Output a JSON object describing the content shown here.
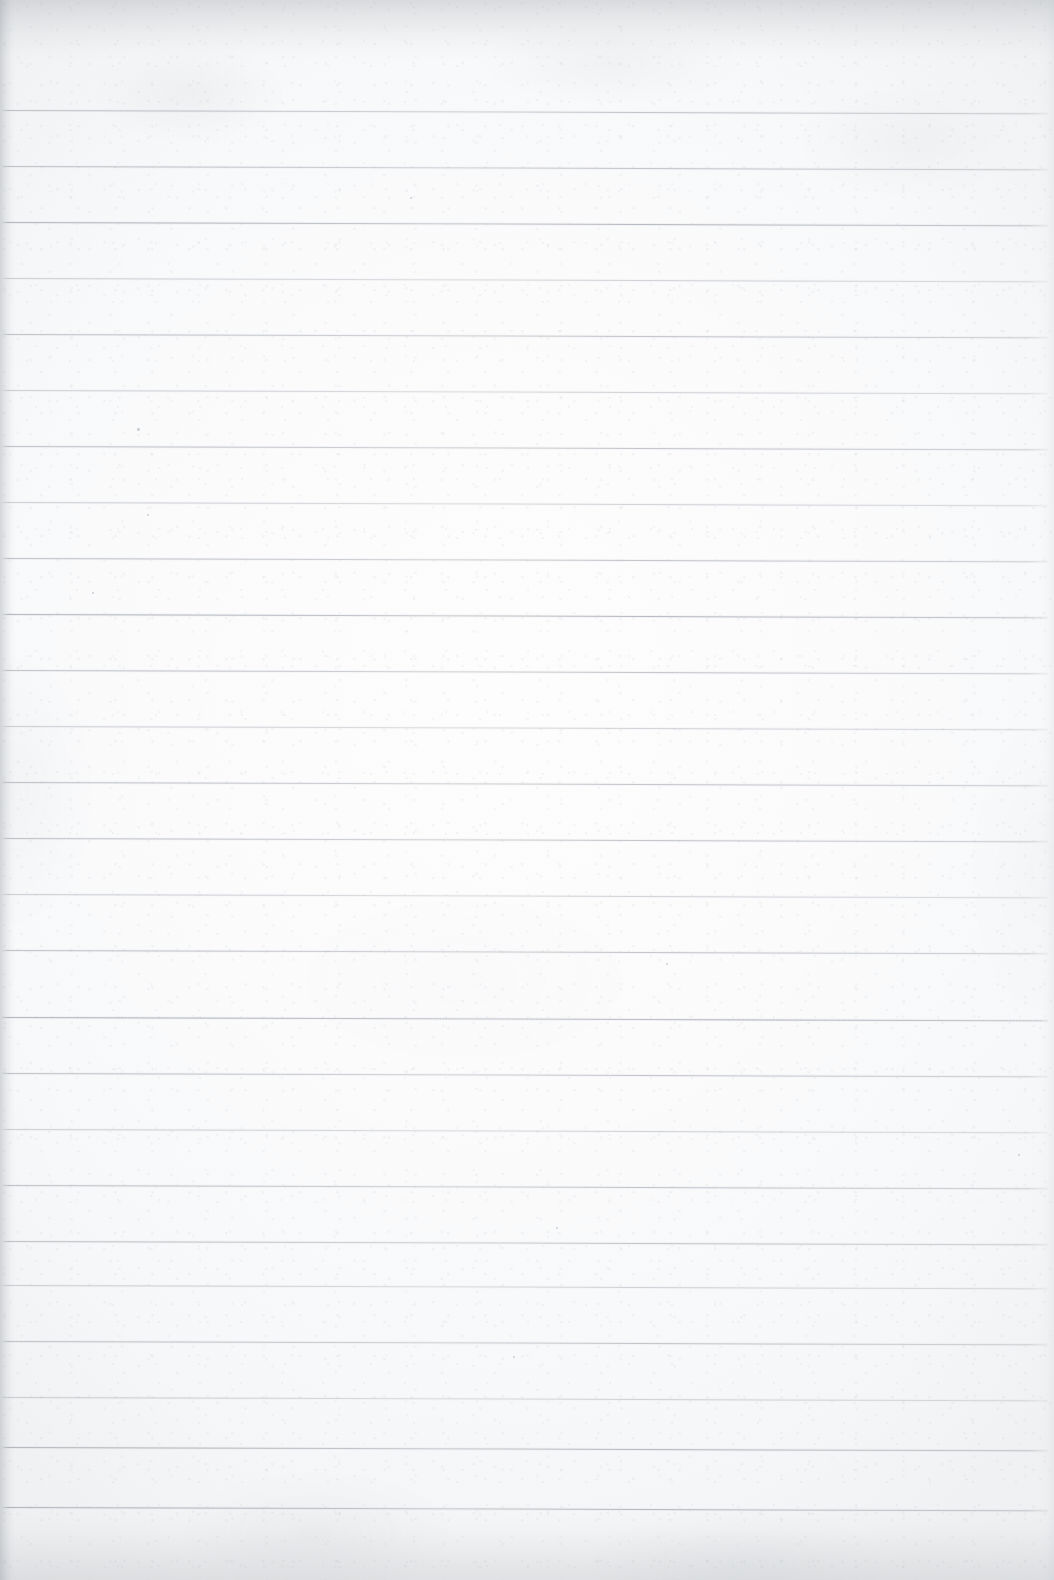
{
  "document": {
    "kind": "scanned-lined-notebook-page",
    "title": "Blank Lined Paper Scan",
    "body_text": "",
    "handwriting": "",
    "page_number": "",
    "width_px": 1054,
    "height_px": 1580
  },
  "paper": {
    "background_color": "#fafbfb",
    "highlight_color": "#fdfdfd",
    "shade_color": "#f2f3f4",
    "texture": "mottled-fibre",
    "edge_shadow_color": "#8f949b"
  },
  "ruling": {
    "line_color": "#b0b5bc",
    "line_thickness_px": 1,
    "line_spacing_px": 55.9,
    "first_line_y_px": 110,
    "last_line_y_px": 1507,
    "line_count": 26,
    "left_margin_px": 2,
    "right_margin_px": 1048,
    "skew_degrees": 0.18,
    "margin_rule": "none",
    "lines": [
      {
        "y": 110,
        "weight": "medium",
        "style": "solid"
      },
      {
        "y": 166,
        "weight": "medium",
        "style": "solid"
      },
      {
        "y": 222,
        "weight": "strong",
        "style": "solid"
      },
      {
        "y": 278,
        "weight": "faint",
        "style": "solid"
      },
      {
        "y": 334,
        "weight": "medium",
        "style": "solid"
      },
      {
        "y": 390,
        "weight": "faint",
        "style": "solid"
      },
      {
        "y": 446,
        "weight": "medium",
        "style": "solid"
      },
      {
        "y": 502,
        "weight": "faint",
        "style": "solid"
      },
      {
        "y": 558,
        "weight": "medium",
        "style": "solid"
      },
      {
        "y": 614,
        "weight": "strong",
        "style": "solid"
      },
      {
        "y": 670,
        "weight": "medium",
        "style": "solid"
      },
      {
        "y": 726,
        "weight": "faint",
        "style": "solid"
      },
      {
        "y": 782,
        "weight": "medium",
        "style": "solid"
      },
      {
        "y": 838,
        "weight": "medium",
        "style": "solid"
      },
      {
        "y": 894,
        "weight": "faint",
        "style": "solid"
      },
      {
        "y": 950,
        "weight": "medium",
        "style": "solid"
      },
      {
        "y": 1017,
        "weight": "strong",
        "style": "dotted"
      },
      {
        "y": 1073,
        "weight": "medium",
        "style": "solid"
      },
      {
        "y": 1129,
        "weight": "faint",
        "style": "solid"
      },
      {
        "y": 1185,
        "weight": "medium",
        "style": "solid"
      },
      {
        "y": 1241,
        "weight": "medium",
        "style": "solid"
      },
      {
        "y": 1285,
        "weight": "faint",
        "style": "solid"
      },
      {
        "y": 1341,
        "weight": "medium",
        "style": "solid"
      },
      {
        "y": 1397,
        "weight": "faint",
        "style": "solid"
      },
      {
        "y": 1447,
        "weight": "strong",
        "style": "solid"
      },
      {
        "y": 1507,
        "weight": "strong",
        "style": "solid"
      }
    ]
  },
  "artifacts": {
    "specks": [
      {
        "x": 410,
        "y": 197,
        "size": 2.2
      },
      {
        "x": 137,
        "y": 428,
        "size": 2.6
      },
      {
        "x": 147,
        "y": 514,
        "size": 2.0
      },
      {
        "x": 556,
        "y": 1227,
        "size": 2.0
      },
      {
        "x": 1018,
        "y": 1154,
        "size": 2.4
      },
      {
        "x": 513,
        "y": 1356,
        "size": 1.8
      },
      {
        "x": 92,
        "y": 592,
        "size": 1.6
      },
      {
        "x": 666,
        "y": 963,
        "size": 1.8
      }
    ]
  }
}
